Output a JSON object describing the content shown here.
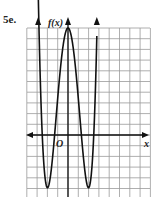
{
  "problem": {
    "number": "5e."
  },
  "chart_data": {
    "type": "line",
    "title": "",
    "xlabel": "x",
    "ylabel": "f(x)",
    "origin_label": "O",
    "grid": true,
    "grid_unit": 1,
    "xlim": [
      -4,
      8
    ],
    "ylim": [
      -6,
      10
    ],
    "series": [
      {
        "name": "f(x)",
        "description": "Even quartic-like polynomial: rises on both ends, local max at (0, 10), local minima near x = -2 and x = 2 (below visible window), x-intercepts near -2.5, -1.3, 1.3, 2.5",
        "x": [
          -2.9,
          -2.5,
          -2.0,
          -1.3,
          -0.6,
          0,
          0.6,
          1.3,
          2.0,
          2.5,
          2.8
        ],
        "y": [
          10.5,
          0,
          -6,
          0,
          7.5,
          10,
          7.5,
          0,
          -6,
          0,
          10.5
        ]
      }
    ],
    "x_intercepts": [
      -2.5,
      -1.3,
      1.3,
      2.5
    ],
    "local_max": [
      0,
      10
    ],
    "local_min_x": [
      -2,
      2
    ]
  },
  "labels": {
    "y_axis": "f(x)",
    "x_axis": "x",
    "origin": "O"
  }
}
